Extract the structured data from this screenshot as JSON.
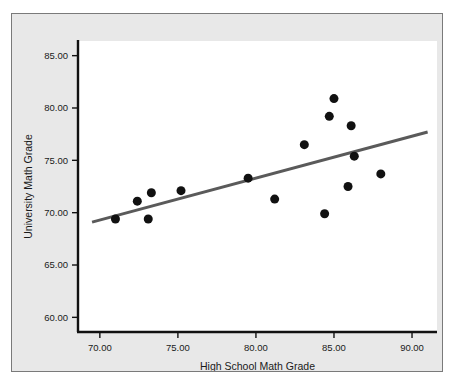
{
  "chart_data": {
    "type": "scatter",
    "title": "",
    "xlabel": "High School Math Grade",
    "ylabel": "University Math Grade",
    "xlim": [
      68.6,
      91.6
    ],
    "ylim": [
      58.6,
      86.4
    ],
    "xticks": [
      70,
      75,
      80,
      85,
      90
    ],
    "xtick_labels": [
      "70.00",
      "75.00",
      "80.00",
      "85.00",
      "90.00"
    ],
    "yticks": [
      60,
      65,
      70,
      75,
      80,
      85
    ],
    "ytick_labels": [
      "60.00",
      "65.00",
      "70.00",
      "75.00",
      "80.00",
      "85.00"
    ],
    "grid": false,
    "legend": null,
    "marker_color": "#111111",
    "marker_size_px": 9,
    "fit_line": {
      "name": "linear fit",
      "color": "#5a5a5a",
      "width_px": 3,
      "x_start": 69.5,
      "y_start": 69.1,
      "x_end": 91.0,
      "y_end": 77.7
    },
    "points": [
      {
        "x": 71.0,
        "y": 69.4
      },
      {
        "x": 72.4,
        "y": 71.1
      },
      {
        "x": 73.1,
        "y": 69.4
      },
      {
        "x": 73.3,
        "y": 71.9
      },
      {
        "x": 75.2,
        "y": 72.1
      },
      {
        "x": 79.5,
        "y": 73.3
      },
      {
        "x": 81.2,
        "y": 71.3
      },
      {
        "x": 83.1,
        "y": 76.5
      },
      {
        "x": 84.4,
        "y": 69.9
      },
      {
        "x": 84.7,
        "y": 79.2
      },
      {
        "x": 85.0,
        "y": 80.9
      },
      {
        "x": 85.9,
        "y": 72.5
      },
      {
        "x": 86.1,
        "y": 78.3
      },
      {
        "x": 86.3,
        "y": 75.4
      },
      {
        "x": 88.0,
        "y": 73.7
      }
    ]
  },
  "figure": {
    "background": "#e8e8e8",
    "panel_background": "#ffffff",
    "border_color": "#7a7a7a",
    "axis_color": "#111111"
  }
}
